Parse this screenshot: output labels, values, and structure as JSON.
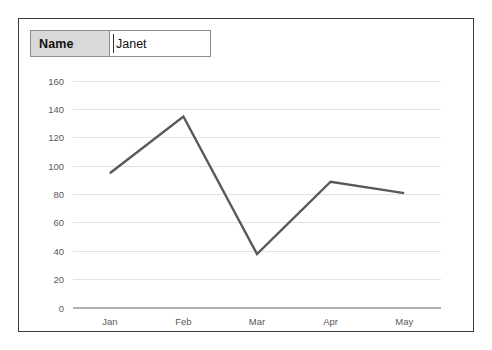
{
  "panel": {
    "border_color": "#3a3a3a",
    "background": "#ffffff"
  },
  "form": {
    "name_label": "Name",
    "name_value": "Janet",
    "name_placeholder": "Name",
    "label_cell_color": "#d9d9d9"
  },
  "chart_data": {
    "type": "line",
    "title": "",
    "subtitle": "",
    "xlabel": "",
    "ylabel": "",
    "categories": [
      "Jan",
      "Feb",
      "Mar",
      "Apr",
      "May"
    ],
    "values": [
      95,
      135,
      38,
      89,
      81
    ],
    "series": [
      {
        "name": "Janet",
        "values": [
          95,
          135,
          38,
          89,
          81
        ]
      }
    ],
    "ylim": [
      0,
      160
    ],
    "ytick_labels": [
      "160",
      "140",
      "120",
      "100",
      "80",
      "60",
      "40",
      "20",
      "0"
    ],
    "ytick_values": [
      160,
      140,
      120,
      100,
      80,
      60,
      40,
      20,
      0
    ],
    "grid": true,
    "grid_color": "#e2e2e2",
    "axis_color": "#b0b0b0",
    "legend": false,
    "legend_position": "none",
    "line_color": "#595959",
    "marker": "none"
  }
}
